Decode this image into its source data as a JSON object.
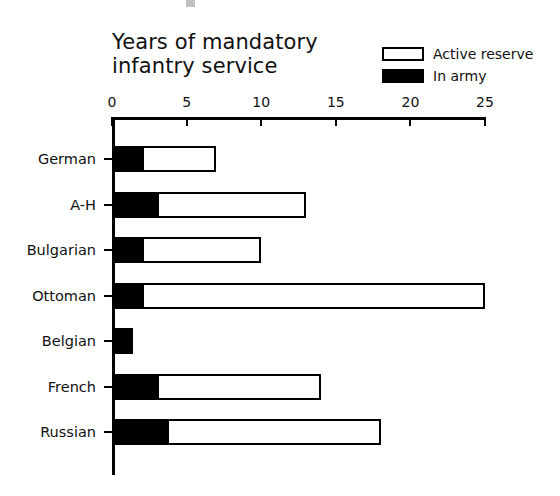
{
  "chart_data": {
    "type": "bar",
    "orientation": "horizontal",
    "stacked": true,
    "title": "Years of mandatory\ninfantry service",
    "xlabel": "",
    "ylabel": "",
    "xlim": [
      0,
      25
    ],
    "xticks": [
      0,
      5,
      10,
      15,
      20,
      25
    ],
    "xtick_labels": [
      "0",
      "5",
      "10",
      "15",
      "20",
      "25"
    ],
    "grid": false,
    "legend_position": "top-right",
    "categories": [
      "German",
      "A-H",
      "Bulgarian",
      "Ottoman",
      "Belgian",
      "French",
      "Russian"
    ],
    "series": [
      {
        "name": "In army",
        "color": "#000000",
        "style": "filled",
        "values": [
          2,
          3,
          2,
          2,
          1.4,
          3,
          3.7
        ]
      },
      {
        "name": "Active reserve",
        "color": "#ffffff",
        "style": "hollow",
        "values": [
          5,
          10,
          8,
          23,
          0,
          11,
          14.3
        ]
      }
    ],
    "totals": [
      7,
      13,
      10,
      25,
      1.4,
      14,
      18
    ]
  },
  "legend": {
    "items": [
      {
        "label": "Active reserve",
        "swatch": "hollow"
      },
      {
        "label": "In army",
        "swatch": "filled"
      }
    ]
  },
  "colors": {
    "ink": "#000000",
    "background": "#ffffff",
    "text": "#111111"
  }
}
